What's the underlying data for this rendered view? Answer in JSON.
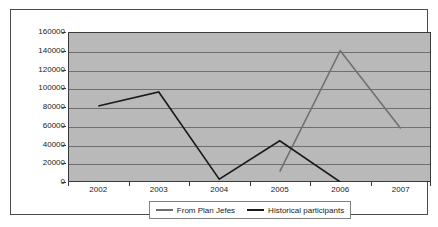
{
  "chart_data": {
    "type": "line",
    "title": "",
    "xlabel": "",
    "ylabel": "",
    "categories": [
      "2002",
      "2003",
      "2004",
      "2005",
      "2006",
      "2007"
    ],
    "ylim": [
      0,
      160000
    ],
    "yticks": [
      0,
      20000,
      40000,
      60000,
      80000,
      100000,
      120000,
      140000,
      160000
    ],
    "ytick_labels": [
      "0",
      "20000",
      "40000",
      "60000",
      "80000",
      "100000",
      "120000",
      "140000",
      "160000"
    ],
    "grid": true,
    "legend_position": "bottom",
    "plot_background": "#b9b9b9",
    "series": [
      {
        "name": "From Plan Jefes",
        "color": "#707070",
        "values": [
          null,
          null,
          null,
          11000,
          140000,
          57000
        ]
      },
      {
        "name": "Historical participants",
        "color": "#1a1a1a",
        "values": [
          81000,
          96000,
          3000,
          44000,
          0,
          null
        ]
      }
    ]
  },
  "legend": {
    "entries": [
      {
        "label": "From Plan Jefes",
        "color": "#707070"
      },
      {
        "label": "Historical participants",
        "color": "#1a1a1a"
      }
    ]
  }
}
